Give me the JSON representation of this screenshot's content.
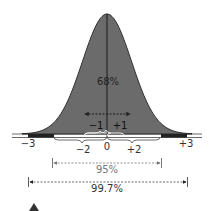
{
  "chart_data": {
    "type": "area",
    "title": "",
    "xlabel": "Standard deviations from mean",
    "ylabel": "",
    "x_ticks": [
      "-3",
      "-2",
      "-1",
      "0",
      "+1",
      "+2",
      "+3"
    ],
    "xlim": [
      -3.4,
      3.4
    ],
    "mean": 0,
    "std": 1,
    "annotations": [
      {
        "label": "68%",
        "range": [
          -1,
          1
        ]
      },
      {
        "label": "95%",
        "range": [
          -2,
          2
        ]
      },
      {
        "label": "99.7%",
        "range": [
          -3,
          3
        ]
      }
    ],
    "colors": {
      "fill": "#6b6b6b",
      "outline": "#222222",
      "tail": "#222222",
      "text": "#333333",
      "muted_text": "#777777"
    }
  },
  "labels": {
    "pct68": "68%",
    "pct95": "95%",
    "pct997": "99.7%",
    "m3": "−3",
    "m2": "−2",
    "m1": "−1",
    "zero": "0",
    "p1": "+1",
    "p2": "+2",
    "p3": "+3"
  }
}
